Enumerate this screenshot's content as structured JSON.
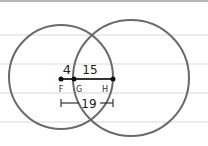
{
  "diagram": {
    "background": {
      "color": "#ffffff",
      "ruled_line_color": "#d9d9d9",
      "ruled_lines_y": [
        35,
        64,
        93,
        122
      ],
      "top_band_color": "#b8b8b8"
    },
    "stroke_color": "#6a6a6a",
    "ink_color": "#222222",
    "circles": [
      {
        "name": "left-circle",
        "cx": 61,
        "cy": 77,
        "r": 52
      },
      {
        "name": "right-circle",
        "cx": 131,
        "cy": 78,
        "r": 58
      }
    ],
    "points": [
      {
        "label": "F",
        "x": 61,
        "y": 79
      },
      {
        "label": "G",
        "x": 74,
        "y": 79
      },
      {
        "label": "H",
        "x": 113,
        "y": 79
      }
    ],
    "segment_labels": {
      "FG": "4",
      "GH": "15",
      "FH": "19"
    }
  }
}
